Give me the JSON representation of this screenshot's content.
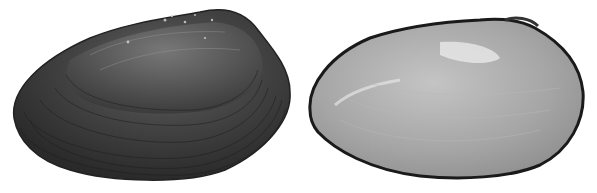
{
  "image": {
    "description": "Two views of a freshwater mussel shell on white background: exterior (left) and interior nacre (right)",
    "background": "#ffffff",
    "panels": [
      {
        "name": "shell-exterior",
        "colors": {
          "dark": "#2a2a2a",
          "mid": "#4a4a4a",
          "light": "#8a8a8a"
        }
      },
      {
        "name": "shell-interior",
        "colors": {
          "rim": "#222222",
          "nacre": "#a8a8a8",
          "highlight": "#e8e8e8"
        }
      }
    ]
  }
}
